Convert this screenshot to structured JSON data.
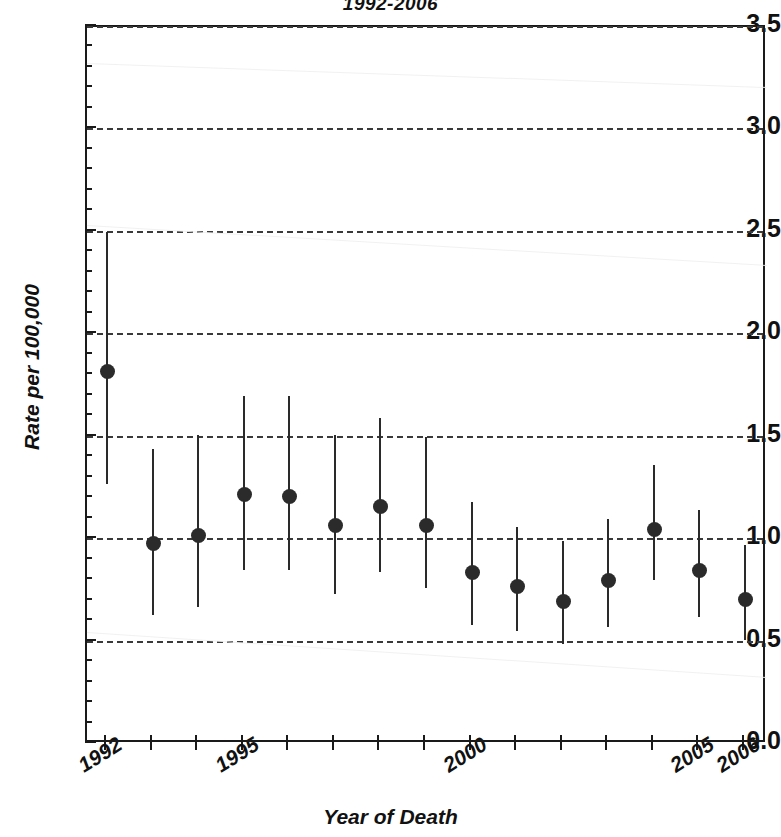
{
  "title": "1992-2006",
  "axes": {
    "xlabel": "Year of Death",
    "ylabel": "Rate per 100,000",
    "y_ticks": [
      "0.0",
      "0.5",
      "1.0",
      "1.5",
      "2.0",
      "2.5",
      "3.0",
      "3.5"
    ],
    "x_tick_labels": [
      "1992",
      "1995",
      "2000",
      "2005",
      "2006"
    ]
  },
  "chart_data": {
    "type": "scatter",
    "title": "1992-2006",
    "xlabel": "Year of Death",
    "ylabel": "Rate per 100,000",
    "ylim": [
      0.0,
      3.5
    ],
    "xlim": [
      1991.5,
      2006.5
    ],
    "grid": true,
    "legend": "none",
    "yticks": [
      0.0,
      0.5,
      1.0,
      1.5,
      2.0,
      2.5,
      3.0,
      3.5
    ],
    "ytick_labels": [
      "0.0",
      "0.5",
      "1.0",
      "1.5",
      "2.0",
      "2.5",
      "3.0",
      "3.5"
    ],
    "xticks": [
      1992,
      1993,
      1994,
      1995,
      1996,
      1997,
      1998,
      1999,
      2000,
      2001,
      2002,
      2003,
      2004,
      2005,
      2006
    ],
    "xtick_labels_shown": [
      "1992",
      "1995",
      "2000",
      "2005",
      "2006"
    ],
    "marker": "filled-circle",
    "error_style": "vertical-line-95ci",
    "x": [
      1992,
      1993,
      1994,
      1995,
      1996,
      1997,
      1998,
      1999,
      2000,
      2001,
      2002,
      2003,
      2004,
      2005,
      2006
    ],
    "values": [
      1.82,
      0.98,
      1.02,
      1.22,
      1.21,
      1.07,
      1.16,
      1.07,
      0.84,
      0.77,
      0.7,
      0.8,
      1.05,
      0.85,
      0.71
    ],
    "ci_low": [
      1.27,
      0.63,
      0.67,
      0.85,
      0.85,
      0.73,
      0.84,
      0.76,
      0.58,
      0.55,
      0.49,
      0.57,
      0.8,
      0.62,
      0.51
    ],
    "ci_high": [
      2.5,
      1.44,
      1.51,
      1.7,
      1.7,
      1.51,
      1.59,
      1.5,
      1.18,
      1.06,
      0.99,
      1.1,
      1.36,
      1.14,
      0.97
    ]
  }
}
